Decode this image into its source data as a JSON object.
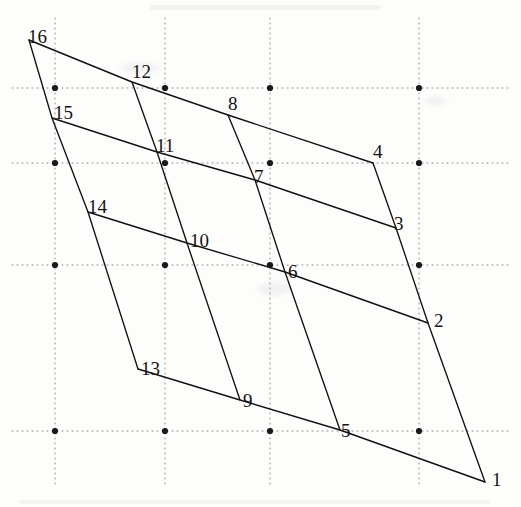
{
  "figure": {
    "type": "geometric-line-diagram",
    "canvas": {
      "width": 521,
      "height": 507
    },
    "ink_color": "#111111",
    "grid_color": "#8c8c8c",
    "background_color": "#fdfdfc",
    "vertices": [
      {
        "label": "1",
        "x": 485,
        "y": 482,
        "label_x": 492,
        "label_y": 470
      },
      {
        "label": "2",
        "x": 428,
        "y": 323,
        "label_x": 434,
        "label_y": 311
      },
      {
        "label": "3",
        "x": 396,
        "y": 228,
        "label_x": 394,
        "label_y": 214
      },
      {
        "label": "4",
        "x": 373,
        "y": 163,
        "label_x": 373,
        "label_y": 142
      },
      {
        "label": "5",
        "x": 340,
        "y": 430,
        "label_x": 341,
        "label_y": 421
      },
      {
        "label": "6",
        "x": 285,
        "y": 272,
        "label_x": 288,
        "label_y": 262
      },
      {
        "label": "7",
        "x": 255,
        "y": 180,
        "label_x": 254,
        "label_y": 167
      },
      {
        "label": "8",
        "x": 228,
        "y": 115,
        "label_x": 228,
        "label_y": 94
      },
      {
        "label": "9",
        "x": 240,
        "y": 400,
        "label_x": 243,
        "label_y": 391
      },
      {
        "label": "10",
        "x": 187,
        "y": 243,
        "label_x": 190,
        "label_y": 231
      },
      {
        "label": "11",
        "x": 157,
        "y": 152,
        "label_x": 156,
        "label_y": 136
      },
      {
        "label": "12",
        "x": 132,
        "y": 82,
        "label_x": 132,
        "label_y": 62
      },
      {
        "label": "13",
        "x": 138,
        "y": 369,
        "label_x": 141,
        "label_y": 359
      },
      {
        "label": "14",
        "x": 88,
        "y": 212,
        "label_x": 88,
        "label_y": 197
      },
      {
        "label": "15",
        "x": 52,
        "y": 118,
        "label_x": 54,
        "label_y": 103
      },
      {
        "label": "16",
        "x": 29,
        "y": 40,
        "label_x": 28,
        "label_y": 27
      }
    ],
    "edges": [
      {
        "name": "row-16-12-8-4",
        "points": "29,40 132,82 228,115 373,163"
      },
      {
        "name": "row-15-11-7-3",
        "points": "52,118 157,152 255,180 396,228"
      },
      {
        "name": "row-14-10-6-2",
        "points": "88,212 187,243 285,272 428,323"
      },
      {
        "name": "row-13-9-5-1",
        "points": "138,369 240,400 340,430 485,482"
      },
      {
        "name": "col-16-15-14-13",
        "points": "29,40 52,118 88,212 138,369"
      },
      {
        "name": "col-12-11-10-9",
        "points": "132,82 157,152 187,243 240,400"
      },
      {
        "name": "col-8-7-6-5",
        "points": "228,115 255,180 285,272 340,430"
      },
      {
        "name": "col-4-3-2-1",
        "points": "373,163 396,228 428,323 485,482"
      }
    ],
    "background_grid": {
      "description": "faint dotted graph-paper rules",
      "columns_x": [
        55,
        165,
        270,
        419
      ],
      "rows_y": [
        88,
        163,
        265,
        431
      ],
      "lattice_dot_radius": 3.1
    }
  }
}
